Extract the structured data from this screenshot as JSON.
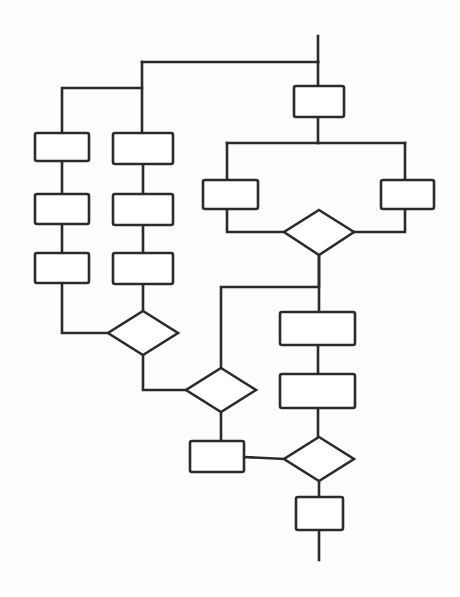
{
  "diagram": {
    "type": "flowchart",
    "style": "hand-drawn-scanned",
    "orientation": "top-to-bottom",
    "canvas": {
      "width": 460,
      "height": 597
    },
    "stroke_color": "#2b2b2b",
    "fill_color": "#ffffff",
    "background_color": "#fdfdfd",
    "stroke_width": 2.6,
    "labels_present": false,
    "nodes": [
      {
        "id": "n1",
        "shape": "process",
        "label": "",
        "x": 294,
        "y": 86,
        "width": 50,
        "height": 31
      },
      {
        "id": "n2",
        "shape": "process",
        "label": "",
        "x": 203,
        "y": 180,
        "width": 55,
        "height": 29
      },
      {
        "id": "n3",
        "shape": "process",
        "label": "",
        "x": 381,
        "y": 180,
        "width": 53,
        "height": 29
      },
      {
        "id": "n4",
        "shape": "decision",
        "label": "",
        "x": 284,
        "y": 210,
        "width": 70,
        "height": 45
      },
      {
        "id": "n5",
        "shape": "process",
        "label": "",
        "x": 35,
        "y": 133,
        "width": 54,
        "height": 28
      },
      {
        "id": "n6",
        "shape": "process",
        "label": "",
        "x": 35,
        "y": 194,
        "width": 54,
        "height": 30
      },
      {
        "id": "n7",
        "shape": "process",
        "label": "",
        "x": 35,
        "y": 253,
        "width": 54,
        "height": 30
      },
      {
        "id": "n8",
        "shape": "process",
        "label": "",
        "x": 113,
        "y": 133,
        "width": 60,
        "height": 31
      },
      {
        "id": "n9",
        "shape": "process",
        "label": "",
        "x": 113,
        "y": 194,
        "width": 60,
        "height": 31
      },
      {
        "id": "n10",
        "shape": "process",
        "label": "",
        "x": 113,
        "y": 253,
        "width": 60,
        "height": 31
      },
      {
        "id": "n11",
        "shape": "decision",
        "label": "",
        "x": 108,
        "y": 311,
        "width": 70,
        "height": 44
      },
      {
        "id": "n12",
        "shape": "decision",
        "label": "",
        "x": 186,
        "y": 368,
        "width": 70,
        "height": 44
      },
      {
        "id": "n13",
        "shape": "process",
        "label": "",
        "x": 190,
        "y": 441,
        "width": 54,
        "height": 31
      },
      {
        "id": "n14",
        "shape": "process",
        "label": "",
        "x": 280,
        "y": 312,
        "width": 75,
        "height": 33
      },
      {
        "id": "n15",
        "shape": "process",
        "label": "",
        "x": 280,
        "y": 374,
        "width": 75,
        "height": 34
      },
      {
        "id": "n16",
        "shape": "decision",
        "label": "",
        "x": 284,
        "y": 437,
        "width": 70,
        "height": 44
      },
      {
        "id": "n17",
        "shape": "process",
        "label": "",
        "x": 296,
        "y": 497,
        "width": 47,
        "height": 33
      }
    ],
    "edges": [
      {
        "from": "entry",
        "to": "split-top",
        "kind": "orthogonal"
      },
      {
        "from": "split-top",
        "to": "n8",
        "kind": "orthogonal"
      },
      {
        "from": "split-top",
        "to": "n5",
        "kind": "orthogonal"
      },
      {
        "from": "split-top",
        "to": "n1",
        "kind": "straight"
      },
      {
        "from": "n1",
        "to": "split-right",
        "kind": "orthogonal"
      },
      {
        "from": "split-right",
        "to": "n2",
        "kind": "orthogonal"
      },
      {
        "from": "split-right",
        "to": "n3",
        "kind": "orthogonal"
      },
      {
        "from": "n2",
        "to": "n4",
        "kind": "orthogonal"
      },
      {
        "from": "n3",
        "to": "n4",
        "kind": "orthogonal"
      },
      {
        "from": "n5",
        "to": "n6",
        "kind": "straight"
      },
      {
        "from": "n6",
        "to": "n7",
        "kind": "straight"
      },
      {
        "from": "n7",
        "to": "n11",
        "kind": "orthogonal"
      },
      {
        "from": "n8",
        "to": "n9",
        "kind": "straight"
      },
      {
        "from": "n9",
        "to": "n10",
        "kind": "straight"
      },
      {
        "from": "n10",
        "to": "n11",
        "kind": "straight"
      },
      {
        "from": "n11",
        "to": "n12",
        "kind": "orthogonal"
      },
      {
        "from": "n4",
        "to": "n12",
        "kind": "orthogonal"
      },
      {
        "from": "n4",
        "to": "n14",
        "kind": "straight"
      },
      {
        "from": "n12",
        "to": "n13",
        "kind": "straight"
      },
      {
        "from": "n13",
        "to": "n16",
        "kind": "straight"
      },
      {
        "from": "n14",
        "to": "n15",
        "kind": "straight"
      },
      {
        "from": "n15",
        "to": "n16",
        "kind": "straight"
      },
      {
        "from": "n16",
        "to": "n17",
        "kind": "straight"
      },
      {
        "from": "n17",
        "to": "exit",
        "kind": "straight"
      }
    ],
    "counts": {
      "process_boxes": 13,
      "decision_diamonds": 4,
      "total_nodes": 17
    }
  }
}
